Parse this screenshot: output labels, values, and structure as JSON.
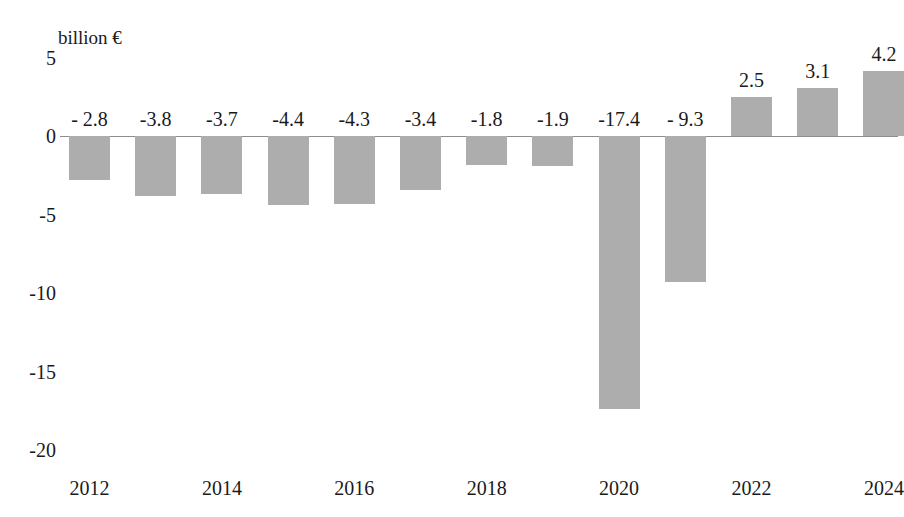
{
  "chart_data": {
    "type": "bar",
    "title": "",
    "subtitle": "",
    "unit_caption": "billion €",
    "xlabel": "",
    "ylabel": "billion €",
    "ylim": [
      -20,
      5
    ],
    "grid": false,
    "legend": null,
    "categories": [
      "2012",
      "2013",
      "2014",
      "2015",
      "2016",
      "2017",
      "2018",
      "2019",
      "2020",
      "2021",
      "2022",
      "2023",
      "2024"
    ],
    "values": [
      -2.8,
      -3.8,
      -3.7,
      -4.4,
      -4.3,
      -3.4,
      -1.8,
      -1.9,
      -17.4,
      -9.3,
      2.5,
      3.1,
      4.2
    ],
    "point_labels": [
      "- 2.8",
      "-3.8",
      "-3.7",
      "-4.4",
      "-4.3",
      "-3.4",
      "-1.8",
      "-1.9",
      "-17.4",
      "- 9.3",
      "2.5",
      "3.1",
      "4.2"
    ],
    "y_ticks": [
      5,
      0,
      -5,
      -10,
      -15,
      -20
    ],
    "y_tick_labels": [
      "5",
      "0",
      "-5",
      "-10",
      "-15",
      "-20"
    ],
    "x_tick_labels": [
      "2012",
      "2014",
      "2016",
      "2018",
      "2020",
      "2022",
      "2024"
    ],
    "x_tick_categories": [
      "2012",
      "2014",
      "2016",
      "2018",
      "2020",
      "2022",
      "2024"
    ],
    "bar_color": "#adadad",
    "axis_color": "#8d8d8d",
    "text_color": "#1a1a1a",
    "background_color": "#ffffff"
  }
}
